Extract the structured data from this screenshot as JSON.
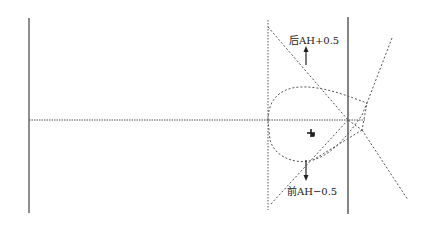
{
  "diagram": {
    "labels": {
      "upper": "后AH+0.5",
      "lower": "前AH−0.5"
    },
    "colors": {
      "solid_line": "#333333",
      "dashed_line": "#555555",
      "background": "#ffffff"
    },
    "elements": {
      "left_vertical_line": {
        "x": 29,
        "y1": 18,
        "y2": 213
      },
      "right_vertical_line": {
        "x": 348,
        "y1": 17,
        "y2": 214
      },
      "dashed_vertical_line": {
        "x": 268,
        "y1": 20,
        "y2": 210
      },
      "horizontal_axis": {
        "y": 120,
        "x1": 29,
        "x2": 372
      },
      "center_marker": {
        "x": 311,
        "y": 133
      }
    }
  }
}
